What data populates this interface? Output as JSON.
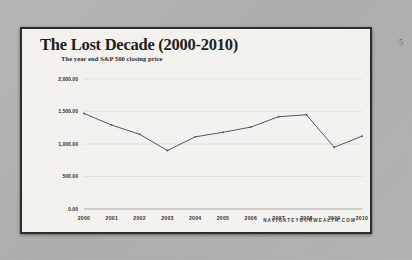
{
  "slide": {
    "page_number": "5",
    "title": "The Lost Decade (2000-2010)",
    "subtitle": "The year end S&P 500 closing price",
    "footer": "NAVIGATEYOURWEALTH.COM",
    "background_color": "#f4f3f0",
    "border_color": "#2b2b2b",
    "canvas_color": "#b2b2b2"
  },
  "chart_data": {
    "type": "line",
    "title": "The Lost Decade (2000-2010)",
    "subtitle": "The year end S&P 500 closing price",
    "xlabel": "",
    "ylabel": "",
    "categories": [
      "2000",
      "2001",
      "2002",
      "2003",
      "2004",
      "2005",
      "2006",
      "2007",
      "2008",
      "2009",
      "2010"
    ],
    "values": [
      1470,
      1290,
      1150,
      900,
      1110,
      1180,
      1260,
      1420,
      1450,
      950,
      1120
    ],
    "series": [
      {
        "name": "S&P 500 year end closing price",
        "values": [
          1470,
          1290,
          1150,
          900,
          1110,
          1180,
          1260,
          1420,
          1450,
          950,
          1120
        ],
        "color": "#55565a"
      }
    ],
    "ylim": [
      0,
      2000
    ],
    "yticks": [
      0,
      500,
      1000,
      1500,
      2000
    ],
    "ytick_labels": [
      "0.00",
      "500.00",
      "1,000.00",
      "1,500.00",
      "2,000.00"
    ],
    "xtick_labels": [
      "2000",
      "2001",
      "2002",
      "2003",
      "2004",
      "2005",
      "2006",
      "2007",
      "2008",
      "2009",
      "2010"
    ],
    "grid": true,
    "grid_color": "#d8d7d2",
    "legend": false,
    "legend_position": "none",
    "markers": true
  }
}
